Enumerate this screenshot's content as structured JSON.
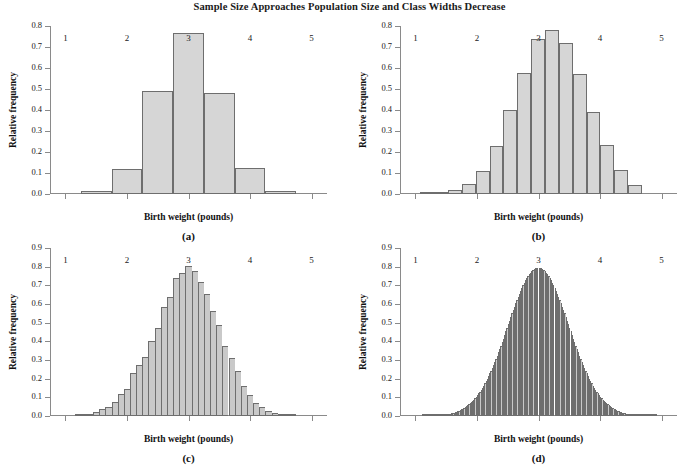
{
  "figure": {
    "title": "Sample Size Approaches Population Size and Class Widths Decrease",
    "xlabel": "Birth weight (pounds)",
    "ylabel": "Relative frequency",
    "bar_fill_color": "#d6d6d6",
    "bar_edge_color": "#6e6e6e",
    "axis_color": "#8a8a8a"
  },
  "panels": [
    {
      "tag": "(a)"
    },
    {
      "tag": "(b)"
    },
    {
      "tag": "(c)"
    },
    {
      "tag": "(d)"
    }
  ],
  "chart_data": [
    {
      "type": "bar",
      "panel": "(a)",
      "title": "Sample Size Approaches Population Size and Class Widths Decrease",
      "xlabel": "Birth weight (pounds)",
      "ylabel": "Relative frequency",
      "xlim": [
        0.75,
        5.25
      ],
      "ylim": [
        0.0,
        0.8
      ],
      "xticks": [
        1,
        2,
        3,
        4,
        5
      ],
      "xtick_labels": [
        "1",
        "2",
        "3",
        "4",
        "5"
      ],
      "yticks": [
        0.0,
        0.1,
        0.2,
        0.3,
        0.4,
        0.5,
        0.6,
        0.7,
        0.8
      ],
      "ytick_labels": [
        "0.0",
        "0.1",
        "0.2",
        "0.3",
        "0.4",
        "0.5",
        "0.6",
        "0.7",
        "0.8"
      ],
      "grid": false,
      "legend": "none",
      "class_width": 0.5,
      "bin_edges": [
        1.25,
        1.75,
        2.25,
        2.75,
        3.25,
        3.75,
        4.25,
        4.75
      ],
      "bin_centers": [
        1.5,
        2.0,
        2.5,
        3.0,
        3.5,
        4.0,
        4.5
      ],
      "values": [
        0.012,
        0.12,
        0.49,
        0.765,
        0.48,
        0.125,
        0.012
      ]
    },
    {
      "type": "bar",
      "panel": "(b)",
      "title": "Sample Size Approaches Population Size and Class Widths Decrease",
      "xlabel": "Birth weight (pounds)",
      "ylabel": "Relative frequency",
      "xlim": [
        0.75,
        5.25
      ],
      "ylim": [
        0.0,
        0.8
      ],
      "xticks": [
        1,
        2,
        3,
        4,
        5
      ],
      "xtick_labels": [
        "1",
        "2",
        "3",
        "4",
        "5"
      ],
      "yticks": [
        0.0,
        0.1,
        0.2,
        0.3,
        0.4,
        0.5,
        0.6,
        0.7,
        0.8
      ],
      "ytick_labels": [
        "0.0",
        "0.1",
        "0.2",
        "0.3",
        "0.4",
        "0.5",
        "0.6",
        "0.7",
        "0.8"
      ],
      "grid": false,
      "legend": "none",
      "class_width": 0.225,
      "bin_edges": [
        1.08,
        1.305,
        1.53,
        1.755,
        1.98,
        2.205,
        2.43,
        2.655,
        2.88,
        3.105,
        3.33,
        3.555,
        3.78,
        4.005,
        4.23,
        4.455,
        4.68
      ],
      "bin_centers": [
        1.19,
        1.42,
        1.64,
        1.87,
        2.09,
        2.32,
        2.54,
        2.77,
        2.99,
        3.22,
        3.44,
        3.67,
        3.89,
        4.12,
        4.34,
        4.57
      ],
      "values": [
        0.004,
        0.008,
        0.018,
        0.046,
        0.11,
        0.23,
        0.4,
        0.575,
        0.74,
        0.78,
        0.72,
        0.57,
        0.39,
        0.235,
        0.113,
        0.044
      ]
    },
    {
      "type": "bar",
      "panel": "(c)",
      "title": "Sample Size Approaches Population Size and Class Widths Decrease",
      "xlabel": "Birth weight (pounds)",
      "ylabel": "Relative frequency",
      "xlim": [
        0.75,
        5.25
      ],
      "ylim": [
        0.0,
        0.9
      ],
      "xticks": [
        1,
        2,
        3,
        4,
        5
      ],
      "xtick_labels": [
        "1",
        "2",
        "3",
        "4",
        "5"
      ],
      "yticks": [
        0.0,
        0.1,
        0.2,
        0.3,
        0.4,
        0.5,
        0.6,
        0.7,
        0.8,
        0.9
      ],
      "ytick_labels": [
        "0.0",
        "0.1",
        "0.2",
        "0.3",
        "0.4",
        "0.5",
        "0.6",
        "0.7",
        "0.8",
        "0.9"
      ],
      "grid": false,
      "legend": "none",
      "class_width": 0.1,
      "bin_start": 1.15,
      "bin_centers": [
        1.2,
        1.3,
        1.4,
        1.5,
        1.6,
        1.7,
        1.8,
        1.9,
        2.0,
        2.1,
        2.2,
        2.3,
        2.4,
        2.5,
        2.6,
        2.7,
        2.8,
        2.9,
        3.0,
        3.1,
        3.2,
        3.3,
        3.4,
        3.5,
        3.6,
        3.7,
        3.8,
        3.9,
        4.0,
        4.1,
        4.2,
        4.3,
        4.4,
        4.5,
        4.6,
        4.7
      ],
      "values": [
        0.006,
        0.008,
        0.012,
        0.02,
        0.035,
        0.05,
        0.075,
        0.118,
        0.145,
        0.23,
        0.275,
        0.318,
        0.4,
        0.47,
        0.585,
        0.635,
        0.74,
        0.765,
        0.805,
        0.775,
        0.72,
        0.655,
        0.56,
        0.49,
        0.375,
        0.31,
        0.24,
        0.16,
        0.115,
        0.072,
        0.048,
        0.025,
        0.018,
        0.01,
        0.006,
        0.005
      ]
    },
    {
      "type": "area",
      "panel": "(d)",
      "title": "Sample Size Approaches Population Size and Class Widths Decrease",
      "xlabel": "Birth weight (pounds)",
      "ylabel": "Relative frequency",
      "xlim": [
        0.75,
        5.25
      ],
      "ylim": [
        0.0,
        0.9
      ],
      "xticks": [
        1,
        2,
        3,
        4,
        5
      ],
      "xtick_labels": [
        "1",
        "2",
        "3",
        "4",
        "5"
      ],
      "yticks": [
        0.0,
        0.1,
        0.2,
        0.3,
        0.4,
        0.5,
        0.6,
        0.7,
        0.8,
        0.9
      ],
      "ytick_labels": [
        "0.0",
        "0.1",
        "0.2",
        "0.3",
        "0.4",
        "0.5",
        "0.6",
        "0.7",
        "0.8",
        "0.9"
      ],
      "grid": false,
      "legend": "none",
      "description": "Smooth normal density curve rendered as very narrow class intervals",
      "distribution": "normal",
      "mean": 3.0,
      "sd": 0.5,
      "peak_value": 0.795,
      "class_width": 0.02,
      "x_start": 1.1,
      "x_end": 4.9
    }
  ]
}
